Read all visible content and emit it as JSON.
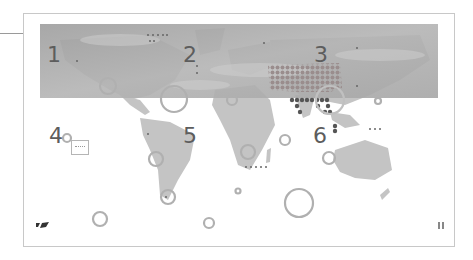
{
  "map": {
    "type": "world-map-infographic",
    "regions": [
      {
        "id": "1",
        "label": "1",
        "area": "North Pacific"
      },
      {
        "id": "2",
        "label": "2",
        "area": "North Atlantic"
      },
      {
        "id": "3",
        "label": "3",
        "area": "Asia"
      },
      {
        "id": "4",
        "label": "4",
        "area": "South Pacific"
      },
      {
        "id": "5",
        "label": "5",
        "area": "South Atlantic"
      },
      {
        "id": "6",
        "label": "6",
        "area": "Indian Ocean"
      }
    ],
    "colors": {
      "land": "#c4c4c4",
      "cloud_band": "#a9a9a9",
      "marker_ring": "#b7b7b7",
      "label": "#5d5d5d",
      "dot_dark": "#555555",
      "frame": "#c8c8c8"
    }
  },
  "icons": {
    "logo": "brand-logo-icon",
    "person": "people-icon"
  }
}
